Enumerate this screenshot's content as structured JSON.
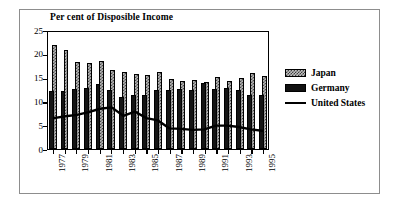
{
  "chart_data": {
    "type": "bar",
    "title": "Per cent of Disposible Income",
    "xlabel": "",
    "ylabel": "",
    "ylim": [
      0,
      25
    ],
    "yticks": [
      0,
      5,
      10,
      15,
      20,
      25
    ],
    "grid": false,
    "legend_position": "right",
    "categories": [
      "1977",
      "1978",
      "1979",
      "1980",
      "1981",
      "1982",
      "1983",
      "1984",
      "1985",
      "1986",
      "1987",
      "1988",
      "1989",
      "1990",
      "1991",
      "1992",
      "1993",
      "1994",
      "1995"
    ],
    "visible_tick_labels": [
      "1977",
      "1979",
      "1981",
      "1983",
      "1985",
      "1987",
      "1989",
      "1991",
      "1993",
      "1995"
    ],
    "series": [
      {
        "name": "Japan",
        "kind": "bar",
        "color": "#b7b7b7",
        "pattern": "checker",
        "values": [
          21.8,
          20.8,
          18.2,
          18.0,
          18.4,
          16.7,
          16.1,
          15.8,
          15.6,
          16.1,
          14.7,
          14.3,
          14.6,
          14.1,
          15.1,
          14.3,
          15.0,
          16.0,
          15.3
        ]
      },
      {
        "name": "Germany",
        "kind": "bar",
        "color": "#151515",
        "pattern": "solid",
        "values": [
          12.2,
          12.1,
          12.6,
          12.8,
          13.6,
          12.5,
          10.9,
          11.4,
          11.4,
          12.3,
          12.4,
          12.6,
          12.4,
          13.8,
          12.6,
          12.9,
          12.3,
          11.4,
          11.4
        ]
      },
      {
        "name": "United States",
        "kind": "line",
        "color": "#000000",
        "values": [
          6.6,
          7.0,
          7.3,
          7.9,
          8.6,
          8.9,
          7.1,
          8.0,
          6.6,
          6.1,
          4.4,
          4.3,
          4.1,
          4.2,
          5.0,
          5.0,
          4.7,
          4.2,
          3.9
        ]
      }
    ]
  },
  "legend": {
    "items": [
      {
        "label": "Japan",
        "swatch": "japan-pattern-swatch"
      },
      {
        "label": "Germany",
        "swatch": "germany-solid-swatch"
      },
      {
        "label": "United States",
        "swatch": "united-states-line-swatch"
      }
    ]
  }
}
